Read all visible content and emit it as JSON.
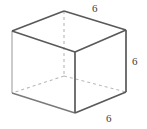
{
  "figure": {
    "name": "cube-diagram",
    "shape_type": "cube",
    "background_color": "#ffffff",
    "solid_edge_color": "#595959",
    "light_edge_color": "#b5b5b5",
    "hidden_edge_color": "#b9b9b9",
    "solid_edge_width": 1.6,
    "light_edge_width": 1.2,
    "hidden_edge_width": 1.1,
    "hidden_edge_dash": "3 3",
    "vertices": {
      "front_top_left": {
        "x": 12,
        "y": 31
      },
      "front_top_right": {
        "x": 126,
        "y": 30
      },
      "front_bottom_left": {
        "x": 12,
        "y": 93
      },
      "front_bottom_right": {
        "x": 126,
        "y": 92
      },
      "center_top": {
        "x": 75,
        "y": 52
      },
      "center_bottom": {
        "x": 75,
        "y": 113
      },
      "back_top": {
        "x": 64,
        "y": 11
      },
      "back_bottom": {
        "x": 64,
        "y": 76
      }
    },
    "labels": {
      "top": "6",
      "right": "6",
      "bottom": "6"
    },
    "label_meaning": {
      "top": "back top edge length",
      "right": "vertical right edge length",
      "bottom": "front bottom edge length"
    }
  }
}
